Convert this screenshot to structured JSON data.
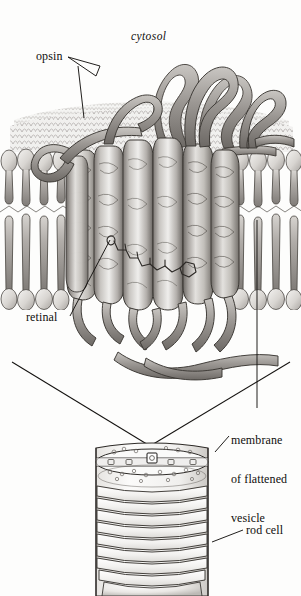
{
  "figure": {
    "background_color": "#fdfdfc",
    "ink_color": "#14120f"
  },
  "labels": {
    "cytosol": "cytosol",
    "opsin": "opsin",
    "retinal": "retinal",
    "membrane_line1": "membrane",
    "membrane_line2": "of flattened",
    "membrane_line3": "vesicle",
    "rod_cell": "rod cell"
  },
  "structures": {
    "opsin_helix_count": 7,
    "rod_cell_disc_count": 10,
    "membrane_leaflets": 2
  }
}
